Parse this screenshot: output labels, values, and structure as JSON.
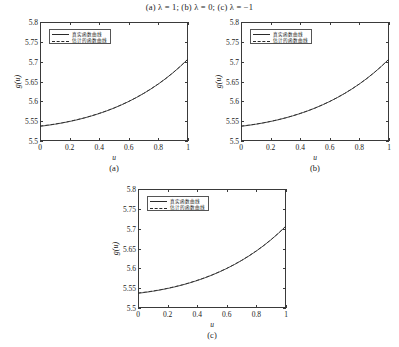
{
  "figure": {
    "caption": "(a) λ = 1; (b) λ = 0; (c) λ = −1",
    "background": "#ffffff",
    "line_color": "#2a2a2a"
  },
  "legend": {
    "true_label": "真实函数曲线",
    "estimated_label": "估计的函数曲线"
  },
  "axis": {
    "xlabel": "u",
    "ylabel": "g(u)",
    "xticks": [
      "0",
      "0.2",
      "0.4",
      "0.6",
      "0.8",
      "1"
    ],
    "xtick_values": [
      0,
      0.2,
      0.4,
      0.6,
      0.8,
      1
    ],
    "yticks": [
      "5.5",
      "5.55",
      "5.6",
      "5.65",
      "5.7",
      "5.75",
      "5.8"
    ],
    "ytick_values": [
      5.5,
      5.55,
      5.6,
      5.65,
      5.7,
      5.75,
      5.8
    ],
    "xlim": [
      0,
      1
    ],
    "ylim": [
      5.5,
      5.8
    ]
  },
  "panels": [
    {
      "tag": "(a)",
      "lambda": "1"
    },
    {
      "tag": "(b)",
      "lambda": "0"
    },
    {
      "tag": "(c)",
      "lambda": "−1"
    }
  ],
  "chart_data": [
    {
      "type": "line",
      "panel": "(a)",
      "title": "",
      "xlabel": "u",
      "ylabel": "g(u)",
      "xlim": [
        0,
        1
      ],
      "ylim": [
        5.5,
        5.8
      ],
      "grid": false,
      "legend_position": "upper left",
      "x": [
        0,
        0.05,
        0.1,
        0.15,
        0.2,
        0.25,
        0.3,
        0.35,
        0.4,
        0.45,
        0.5,
        0.55,
        0.6,
        0.65,
        0.7,
        0.75,
        0.8,
        0.85,
        0.9,
        0.95,
        1
      ],
      "series": [
        {
          "name": "真实函数曲线",
          "style": "solid",
          "values": [
            5.537,
            5.5395,
            5.5423,
            5.5455,
            5.5492,
            5.5534,
            5.5581,
            5.5634,
            5.5693,
            5.5758,
            5.583,
            5.591,
            5.5997,
            5.6093,
            5.6198,
            5.6313,
            5.6438,
            5.6575,
            5.6724,
            5.6887,
            5.7065
          ]
        },
        {
          "name": "估计的函数曲线",
          "style": "dashed",
          "values": [
            5.5378,
            5.5399,
            5.5426,
            5.5459,
            5.5496,
            5.5537,
            5.5584,
            5.5637,
            5.5696,
            5.576,
            5.5832,
            5.5912,
            5.5999,
            5.6095,
            5.62,
            5.6315,
            5.644,
            5.6577,
            5.6726,
            5.6889,
            5.7067
          ]
        }
      ]
    },
    {
      "type": "line",
      "panel": "(b)",
      "title": "",
      "xlabel": "u",
      "ylabel": "g(u)",
      "xlim": [
        0,
        1
      ],
      "ylim": [
        5.5,
        5.8
      ],
      "grid": false,
      "legend_position": "upper left",
      "x": [
        0,
        0.05,
        0.1,
        0.15,
        0.2,
        0.25,
        0.3,
        0.35,
        0.4,
        0.45,
        0.5,
        0.55,
        0.6,
        0.65,
        0.7,
        0.75,
        0.8,
        0.85,
        0.9,
        0.95,
        1
      ],
      "series": [
        {
          "name": "真实函数曲线",
          "style": "solid",
          "values": [
            5.537,
            5.5395,
            5.5423,
            5.5455,
            5.5492,
            5.5534,
            5.5581,
            5.5634,
            5.5693,
            5.5758,
            5.583,
            5.591,
            5.5997,
            5.6093,
            5.6198,
            5.6313,
            5.6438,
            5.6575,
            5.6724,
            5.6887,
            5.7065
          ]
        },
        {
          "name": "估计的函数曲线",
          "style": "dashed",
          "values": [
            5.5377,
            5.5398,
            5.5425,
            5.5458,
            5.5495,
            5.5536,
            5.5583,
            5.5636,
            5.5695,
            5.5759,
            5.5831,
            5.5911,
            5.5998,
            5.6094,
            5.6199,
            5.6314,
            5.6439,
            5.6576,
            5.6725,
            5.6888,
            5.7066
          ]
        }
      ]
    },
    {
      "type": "line",
      "panel": "(c)",
      "title": "",
      "xlabel": "u",
      "ylabel": "g(u)",
      "xlim": [
        0,
        1
      ],
      "ylim": [
        5.5,
        5.8
      ],
      "grid": false,
      "legend_position": "upper left",
      "x": [
        0,
        0.05,
        0.1,
        0.15,
        0.2,
        0.25,
        0.3,
        0.35,
        0.4,
        0.45,
        0.5,
        0.55,
        0.6,
        0.65,
        0.7,
        0.75,
        0.8,
        0.85,
        0.9,
        0.95,
        1
      ],
      "series": [
        {
          "name": "真实函数曲线",
          "style": "solid",
          "values": [
            5.537,
            5.5395,
            5.5423,
            5.5455,
            5.5492,
            5.5534,
            5.5581,
            5.5634,
            5.5693,
            5.5758,
            5.583,
            5.591,
            5.5997,
            5.6093,
            5.6198,
            5.6313,
            5.6438,
            5.6575,
            5.6724,
            5.6887,
            5.7065
          ]
        },
        {
          "name": "估计的函数曲线",
          "style": "dashed",
          "values": [
            5.5379,
            5.54,
            5.5427,
            5.546,
            5.5497,
            5.5538,
            5.5585,
            5.5638,
            5.5697,
            5.5761,
            5.5833,
            5.5913,
            5.6,
            5.6096,
            5.6201,
            5.6316,
            5.6441,
            5.6578,
            5.6727,
            5.689,
            5.7068
          ]
        }
      ]
    }
  ]
}
